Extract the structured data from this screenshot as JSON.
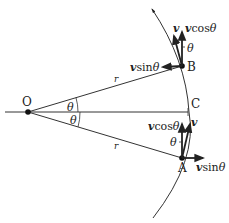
{
  "diagram": {
    "title": "",
    "colors": {
      "stroke": "#222222",
      "background": "#ffffff"
    },
    "points": {
      "O": {
        "label": "O",
        "x": 28,
        "y": 112
      },
      "C": {
        "label": "C",
        "x": 188,
        "y": 112
      },
      "B": {
        "label": "B",
        "x": 182,
        "y": 66
      },
      "A": {
        "label": "A",
        "x": 182,
        "y": 158
      }
    },
    "radius_labels": {
      "upper": "r",
      "lower": "r"
    },
    "angle_labels": {
      "upper": "θ",
      "lower": "θ",
      "at_B": "θ",
      "at_A": "θ"
    },
    "vectors": {
      "B": {
        "v": "v",
        "vcos": "vcosθ",
        "vcos_coef": "v",
        "vcos_fn": "cos",
        "vcos_ang": "θ",
        "vsin_coef": "v",
        "vsin_fn": "sin",
        "vsin_ang": "θ"
      },
      "A": {
        "v": "v",
        "vcos_coef": "v",
        "vcos_fn": "cos",
        "vcos_ang": "θ",
        "vsin_coef": "v",
        "vsin_fn": "sin",
        "vsin_ang": "θ"
      }
    }
  }
}
